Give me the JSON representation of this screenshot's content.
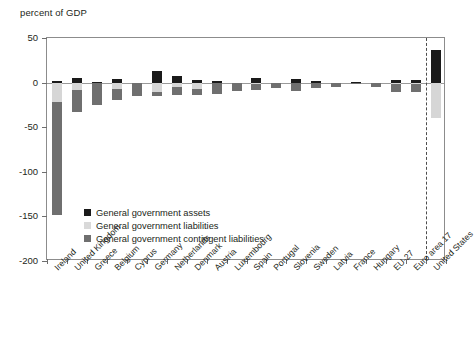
{
  "chart_data": {
    "type": "bar",
    "stacked": true,
    "title": "",
    "subtitle": "",
    "ylabel": "percent of GDP",
    "xlabel": "",
    "ylim": [
      -200,
      50
    ],
    "yticks": [
      50,
      0,
      -50,
      -100,
      -150,
      -200
    ],
    "ytick_labels": [
      "50",
      "0",
      "-50",
      "-100",
      "-150",
      "-200"
    ],
    "grid": false,
    "legend_position": "inside-lower-left",
    "annotations": [
      {
        "type": "vertical-dashed-line",
        "after_category": "Euro area 17"
      }
    ],
    "categories": [
      "Ireland",
      "United Kingdom",
      "Greece",
      "Belgium",
      "Cyprus",
      "Germany",
      "Netherlands",
      "Denmark",
      "Austria",
      "Luxembourg",
      "Spain",
      "Portugal",
      "Slovenia",
      "Sweden",
      "Latvia",
      "France",
      "Hungary",
      "EU-27",
      "Euro area 17",
      "United States"
    ],
    "series": [
      {
        "name": "General government assets",
        "color": "#1a1a1a",
        "values": [
          1.5,
          5.0,
          1.0,
          4.0,
          0.0,
          12.5,
          7.0,
          3.0,
          1.5,
          0.0,
          5.5,
          0.0,
          3.5,
          1.5,
          0.0,
          1.0,
          0.0,
          3.0,
          3.0,
          37.0
        ]
      },
      {
        "name": "General government liabilities",
        "color": "#d6d6d6",
        "values": [
          -22.0,
          -8.0,
          -0.5,
          -7.0,
          0.0,
          -11.0,
          -5.0,
          -7.0,
          -1.0,
          0.0,
          -2.0,
          0.0,
          -1.0,
          0.0,
          0.0,
          0.0,
          0.0,
          -1.5,
          -1.5,
          -40.0
        ]
      },
      {
        "name": "General government contingent liabilities",
        "color": "#6f6f6f",
        "values": [
          -126.0,
          -25.0,
          -25.0,
          -13.0,
          -15.0,
          -4.0,
          -9.0,
          -7.0,
          -12.0,
          -9.0,
          -6.0,
          -6.0,
          -8.0,
          -6.0,
          -5.0,
          -0.5,
          -5.0,
          -8.5,
          -9.5,
          0.0
        ]
      }
    ]
  },
  "legend": {
    "items": [
      {
        "label": "General government assets",
        "color": "#1a1a1a"
      },
      {
        "label": "General government liabilities",
        "color": "#d9d9d9"
      },
      {
        "label": "General government contingent liabilities",
        "color": "#6f6f6f"
      }
    ]
  }
}
